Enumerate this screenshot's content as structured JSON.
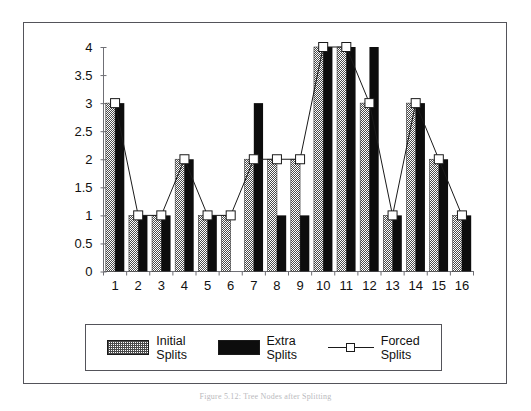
{
  "figure": {
    "caption": "Figure 5.12: Tree Nodes after Splitting"
  },
  "chart_data": {
    "type": "bar",
    "title": "",
    "xlabel": "",
    "ylabel": "",
    "ylim": [
      0,
      4
    ],
    "ytick_step": 0.5,
    "grid": false,
    "legend_position": "bottom",
    "categories": [
      "1",
      "2",
      "3",
      "4",
      "5",
      "6",
      "7",
      "8",
      "9",
      "10",
      "11",
      "12",
      "13",
      "14",
      "15",
      "16"
    ],
    "yticks": [
      "0",
      "0.5",
      "1",
      "1.5",
      "2",
      "2.5",
      "3",
      "3.5",
      "4"
    ],
    "series": [
      {
        "name": "Initial Splits",
        "label_line1": "Initial",
        "label_line2": "Splits",
        "render": "bar",
        "fill": "hatch-gray",
        "values": [
          3,
          1,
          1,
          2,
          1,
          1,
          2,
          2,
          2,
          4,
          4,
          3,
          1,
          3,
          2,
          1
        ]
      },
      {
        "name": "Extra Splits",
        "label_line1": "Extra",
        "label_line2": "Splits",
        "render": "bar",
        "fill": "solid-black",
        "values": [
          3,
          1,
          1,
          2,
          1,
          0,
          3,
          1,
          1,
          4,
          4,
          4,
          1,
          3,
          2,
          1
        ]
      },
      {
        "name": "Forced Splits",
        "label_line1": "Forced",
        "label_line2": "Splits",
        "render": "line-marker",
        "marker": "open-square",
        "values": [
          3,
          1,
          1,
          2,
          1,
          1,
          2,
          2,
          2,
          4,
          4,
          3,
          1,
          3,
          2,
          1
        ]
      }
    ]
  },
  "colors": {
    "frame": "#54545a",
    "axis": "#6f6f75",
    "bar_initial": "#4a4a4a",
    "bar_extra": "#0d0d0d",
    "line": "#1a1a1a",
    "marker_fill": "#ffffff",
    "text": "#111111"
  }
}
